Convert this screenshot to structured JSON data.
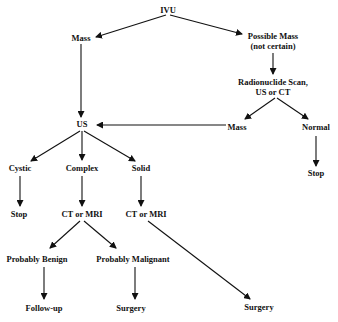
{
  "diagram": {
    "type": "flowchart",
    "nodes": {
      "ivu": {
        "label": "IVU"
      },
      "mass_left": {
        "label": "Mass"
      },
      "possible_mass": {
        "line1": "Possible Mass",
        "line2": "(not certain)"
      },
      "radionuclide": {
        "line1": "Radionuclide Scan,",
        "line2": "US or CT"
      },
      "us": {
        "label": "US"
      },
      "mass_right": {
        "label": "Mass"
      },
      "normal": {
        "label": "Normal"
      },
      "stop_right": {
        "label": "Stop"
      },
      "cystic": {
        "label": "Cystic"
      },
      "complex": {
        "label": "Complex"
      },
      "solid": {
        "label": "Solid"
      },
      "stop_left": {
        "label": "Stop"
      },
      "ct_mri_complex": {
        "label": "CT or MRI"
      },
      "ct_mri_solid": {
        "label": "CT or MRI"
      },
      "probably_benign": {
        "label": "Probably Benign"
      },
      "probably_malignant": {
        "label": "Probably Malignant"
      },
      "follow_up": {
        "label": "Follow-up"
      },
      "surgery_malignant": {
        "label": "Surgery"
      },
      "surgery_solid": {
        "label": "Surgery"
      }
    },
    "edges": [
      {
        "from": "ivu",
        "to": "mass_left"
      },
      {
        "from": "ivu",
        "to": "possible_mass"
      },
      {
        "from": "possible_mass",
        "to": "radionuclide"
      },
      {
        "from": "radionuclide",
        "to": "mass_right"
      },
      {
        "from": "radionuclide",
        "to": "normal"
      },
      {
        "from": "mass_left",
        "to": "us"
      },
      {
        "from": "mass_right",
        "to": "us"
      },
      {
        "from": "normal",
        "to": "stop_right"
      },
      {
        "from": "us",
        "to": "cystic"
      },
      {
        "from": "us",
        "to": "complex"
      },
      {
        "from": "us",
        "to": "solid"
      },
      {
        "from": "cystic",
        "to": "stop_left"
      },
      {
        "from": "complex",
        "to": "ct_mri_complex"
      },
      {
        "from": "solid",
        "to": "ct_mri_solid"
      },
      {
        "from": "ct_mri_complex",
        "to": "probably_benign"
      },
      {
        "from": "ct_mri_complex",
        "to": "probably_malignant"
      },
      {
        "from": "ct_mri_solid",
        "to": "surgery_solid"
      },
      {
        "from": "probably_benign",
        "to": "follow_up"
      },
      {
        "from": "probably_malignant",
        "to": "surgery_malignant"
      }
    ],
    "colors": {
      "line": "#111111",
      "text": "#111111",
      "background": "#ffffff"
    }
  }
}
